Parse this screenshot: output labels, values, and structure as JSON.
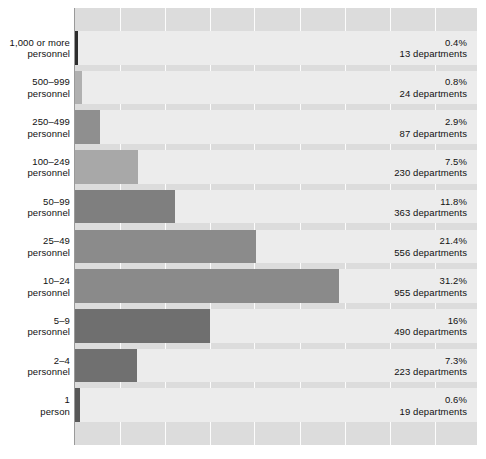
{
  "chart_data": {
    "type": "bar",
    "orientation": "horizontal",
    "title": "",
    "subtitle": "",
    "xlabel": "",
    "ylabel": "",
    "xlim": [
      0,
      47.5
    ],
    "grid": "vertical",
    "legend": "none",
    "value_suffix": "departments",
    "categories": [
      "1,000 or more personnel",
      "500–999 personnel",
      "250–499 personnel",
      "100–249 personnel",
      "50–99 personnel",
      "25–49 personnel",
      "10–24 personnel",
      "5–9 personnel",
      "2–4 personnel",
      "1 person"
    ],
    "values": [
      0.4,
      0.8,
      2.9,
      7.5,
      11.8,
      21.4,
      31.2,
      16,
      7.3,
      0.6
    ],
    "counts": [
      13,
      24,
      87,
      230,
      363,
      556,
      955,
      490,
      223,
      19
    ],
    "rows": [
      {
        "label_line1": "1,000 or more",
        "label_line2": "personnel",
        "percent_text": "0.4%",
        "count_text": "13 departments",
        "value": 0.4,
        "count": 13,
        "bar_color": "#2d2d2d"
      },
      {
        "label_line1": "500–999",
        "label_line2": "personnel",
        "percent_text": "0.8%",
        "count_text": "24 departments",
        "value": 0.8,
        "count": 24,
        "bar_color": "#b0b0b0"
      },
      {
        "label_line1": "250–499",
        "label_line2": "personnel",
        "percent_text": "2.9%",
        "count_text": "87 departments",
        "value": 2.9,
        "count": 87,
        "bar_color": "#8f8f8f"
      },
      {
        "label_line1": "100–249",
        "label_line2": "personnel",
        "percent_text": "7.5%",
        "count_text": "230 departments",
        "value": 7.5,
        "count": 230,
        "bar_color": "#a8a8a8"
      },
      {
        "label_line1": "50–99",
        "label_line2": "personnel",
        "percent_text": "11.8%",
        "count_text": "363 departments",
        "value": 11.8,
        "count": 363,
        "bar_color": "#7f7f7f"
      },
      {
        "label_line1": "25–49",
        "label_line2": "personnel",
        "percent_text": "21.4%",
        "count_text": "556 departments",
        "value": 21.4,
        "count": 556,
        "bar_color": "#8b8b8b"
      },
      {
        "label_line1": "10–24",
        "label_line2": "personnel",
        "percent_text": "31.2%",
        "count_text": "955 departments",
        "value": 31.2,
        "count": 955,
        "bar_color": "#8a8a8a"
      },
      {
        "label_line1": "5–9",
        "label_line2": "personnel",
        "percent_text": "16%",
        "count_text": "490 departments",
        "value": 16,
        "count": 490,
        "bar_color": "#6f6f6f"
      },
      {
        "label_line1": "2–4",
        "label_line2": "personnel",
        "percent_text": "7.3%",
        "count_text": "223 departments",
        "value": 7.3,
        "count": 223,
        "bar_color": "#707070"
      },
      {
        "label_line1": "1",
        "label_line2": "person",
        "percent_text": "0.6%",
        "count_text": "19 departments",
        "value": 0.6,
        "count": 19,
        "bar_color": "#585858"
      }
    ],
    "gridline_positions_pct": [
      5.3,
      10.6,
      15.9,
      21.2,
      26.6,
      31.9,
      37.2,
      42.5
    ],
    "colors": {
      "panel_background": "#dcdcdc",
      "row_band": "#ececec",
      "gridline": "#fdfdfd",
      "axis": "#9a9a9a",
      "text": "#111111"
    }
  }
}
